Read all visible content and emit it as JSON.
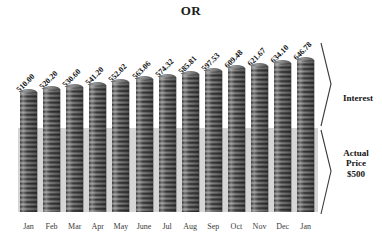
{
  "chart": {
    "title": "OR"
  },
  "annotations": {
    "interest": "Interest",
    "actual_price_line1": "Actual",
    "actual_price_line2": "Price",
    "actual_price_line3": "$500"
  },
  "chart_data": {
    "type": "bar",
    "title": "OR",
    "xlabel": "",
    "ylabel": "",
    "grid": false,
    "legend": "none",
    "baseline_value": 500,
    "baseline_label": "Actual Price $500",
    "growth_label": "Interest",
    "ylim": [
      0,
      700
    ],
    "categories": [
      "Jan",
      "Feb",
      "Mar",
      "Apr",
      "May",
      "June",
      "Jul",
      "Aug",
      "Sep",
      "Oct",
      "Nov",
      "Dec",
      "Jan"
    ],
    "values": [
      510.0,
      520.2,
      530.6,
      541.2,
      552.02,
      563.06,
      574.32,
      585.81,
      597.53,
      609.48,
      621.67,
      634.1,
      646.78
    ],
    "value_labels": [
      "510.00",
      "520.20",
      "530.60",
      "541.20",
      "552.02",
      "563.06",
      "574.32",
      "585.81",
      "597.53",
      "609.48",
      "621.67",
      "634.10",
      "646.78"
    ],
    "series": [
      {
        "name": "Balance",
        "values": [
          510.0,
          520.2,
          530.6,
          541.2,
          552.02,
          563.06,
          574.32,
          585.81,
          597.53,
          609.48,
          621.67,
          634.1,
          646.78
        ]
      }
    ],
    "annotations": [
      {
        "text": "Interest",
        "region": "above-baseline"
      },
      {
        "text": "Actual Price $500",
        "region": "baseline"
      }
    ]
  }
}
